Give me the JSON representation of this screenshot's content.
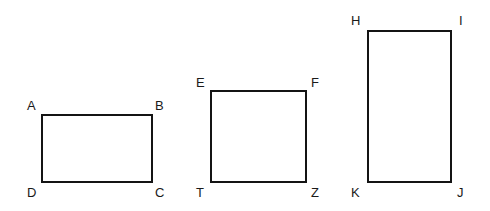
{
  "figure": {
    "title": "",
    "background_color": "#ffffff",
    "stroke_color": "#141414",
    "label_color": "#1a1a1a",
    "stroke_width_px": 2,
    "canvas": {
      "width": 490,
      "height": 211
    }
  },
  "shapes": [
    {
      "name": "rectangle-abcd",
      "type": "rectangle",
      "x": 41,
      "y": 114,
      "width": 112,
      "height": 69,
      "vertices": [
        {
          "key": "A",
          "label": "A",
          "corner": "top-left",
          "lx": 27,
          "ly": 99
        },
        {
          "key": "B",
          "label": "B",
          "corner": "top-right",
          "lx": 155,
          "ly": 99
        },
        {
          "key": "C",
          "label": "C",
          "corner": "bottom-right",
          "lx": 155,
          "ly": 186
        },
        {
          "key": "D",
          "label": "D",
          "corner": "bottom-left",
          "lx": 27,
          "ly": 186
        }
      ]
    },
    {
      "name": "rectangle-eftz",
      "type": "rectangle",
      "x": 210,
      "y": 90,
      "width": 97,
      "height": 93,
      "vertices": [
        {
          "key": "E",
          "label": "E",
          "corner": "top-left",
          "lx": 196,
          "ly": 76
        },
        {
          "key": "F",
          "label": "F",
          "corner": "top-right",
          "lx": 311,
          "ly": 76
        },
        {
          "key": "Z",
          "label": "Z",
          "corner": "bottom-right",
          "lx": 311,
          "ly": 186
        },
        {
          "key": "T",
          "label": "T",
          "corner": "bottom-left",
          "lx": 196,
          "ly": 186
        }
      ]
    },
    {
      "name": "rectangle-hijk",
      "type": "rectangle",
      "x": 367,
      "y": 30,
      "width": 85,
      "height": 153,
      "vertices": [
        {
          "key": "H",
          "label": "H",
          "corner": "top-left",
          "lx": 351,
          "ly": 14
        },
        {
          "key": "I",
          "label": "I",
          "corner": "top-right",
          "lx": 459,
          "ly": 14
        },
        {
          "key": "J",
          "label": "J",
          "corner": "bottom-right",
          "lx": 457,
          "ly": 186
        },
        {
          "key": "K",
          "label": "K",
          "corner": "bottom-left",
          "lx": 351,
          "ly": 186
        }
      ]
    }
  ]
}
